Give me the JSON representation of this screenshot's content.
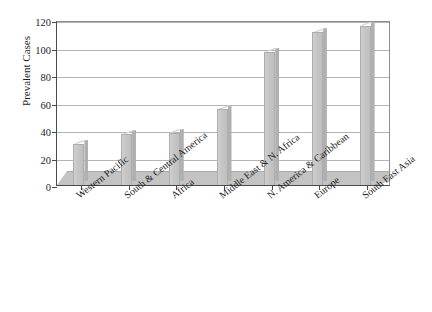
{
  "chart_data": {
    "type": "bar",
    "title": "",
    "xlabel": "",
    "ylabel": "Prevalent Cases",
    "ylim": [
      0,
      120
    ],
    "yticks": [
      0,
      20,
      40,
      60,
      80,
      100,
      120
    ],
    "grid": true,
    "legend": false,
    "categories": [
      "Western Pacific",
      "South & Central America",
      "Africa",
      "Middle East & N. Africa",
      "N. America & Caribbean",
      "Europe",
      "South East Asia"
    ],
    "values": [
      30,
      37,
      38,
      55,
      97,
      111,
      116
    ],
    "series": [
      {
        "name": "Prevalent Cases",
        "values": [
          30,
          37,
          38,
          55,
          97,
          111,
          116
        ]
      }
    ]
  },
  "style": {
    "bar_fill": "#c6c6c6",
    "bar_top": "#d6d6d6",
    "bar_side": "#b0b0b0",
    "floor": "#c3c3c3",
    "gridline": "#b4b4b4",
    "axis": "#4a4a4a",
    "background": "#ffffff",
    "text": "#1c1c1c"
  }
}
